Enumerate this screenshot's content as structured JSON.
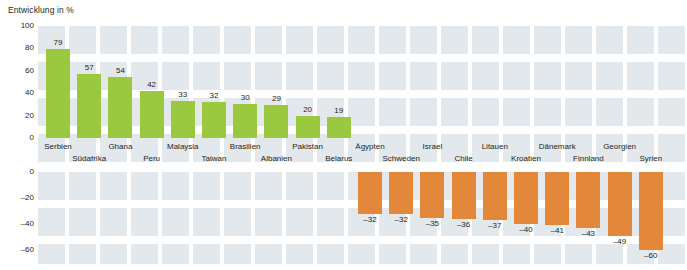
{
  "chart": {
    "title": "Entwicklung in %"
  },
  "chart_data": {
    "type": "bar",
    "title": "Entwicklung in %",
    "xlabel": "",
    "ylabel": "Entwicklung in %",
    "ylim": [
      -80,
      100
    ],
    "grid": true,
    "legend": false,
    "yticks": [
      "100",
      "80",
      "60",
      "40",
      "20",
      "0",
      "0",
      "-20",
      "-40",
      "-60",
      "-80"
    ],
    "ytick_values": [
      100,
      80,
      60,
      40,
      20,
      0,
      0,
      -20,
      -40,
      -60,
      -80
    ],
    "series_colors": {
      "positive": "#9ac83f",
      "negative": "#e3873a"
    },
    "categories": [
      "Serbien",
      "Südafrika",
      "Ghana",
      "Peru",
      "Malaysia",
      "Taiwan",
      "Brasilien",
      "Albanien",
      "Pakistan",
      "Belarus",
      "Ägypten",
      "Schweden",
      "Israel",
      "Chile",
      "Litauen",
      "Kroatien",
      "Dänemark",
      "Finnland",
      "Georgien",
      "Syrien"
    ],
    "values": [
      79,
      57,
      54,
      42,
      33,
      32,
      30,
      29,
      20,
      19,
      -32,
      -32,
      -35,
      -36,
      -37,
      -40,
      -41,
      -43,
      -49,
      -60
    ],
    "value_labels": [
      "79",
      "57",
      "54",
      "42",
      "33",
      "32",
      "30",
      "29",
      "20",
      "19",
      "–32",
      "–32",
      "–35",
      "–36",
      "–37",
      "–40",
      "–41",
      "–43",
      "–49",
      "–60"
    ]
  },
  "bars": [
    {
      "label": "Serbien",
      "value_label": "79",
      "value": 79,
      "sign": "pos",
      "row": 0
    },
    {
      "label": "Südafrika",
      "value_label": "57",
      "value": 57,
      "sign": "pos",
      "row": 1
    },
    {
      "label": "Ghana",
      "value_label": "54",
      "value": 54,
      "sign": "pos",
      "row": 0
    },
    {
      "label": "Peru",
      "value_label": "42",
      "value": 42,
      "sign": "pos",
      "row": 1
    },
    {
      "label": "Malaysia",
      "value_label": "33",
      "value": 33,
      "sign": "pos",
      "row": 0
    },
    {
      "label": "Taiwan",
      "value_label": "32",
      "value": 32,
      "sign": "pos",
      "row": 1
    },
    {
      "label": "Brasilien",
      "value_label": "30",
      "value": 30,
      "sign": "pos",
      "row": 0
    },
    {
      "label": "Albanien",
      "value_label": "29",
      "value": 29,
      "sign": "pos",
      "row": 1
    },
    {
      "label": "Pakistan",
      "value_label": "20",
      "value": 20,
      "sign": "pos",
      "row": 0
    },
    {
      "label": "Belarus",
      "value_label": "19",
      "value": 19,
      "sign": "pos",
      "row": 1
    },
    {
      "label": "Ägypten",
      "value_label": "–32",
      "value": -32,
      "sign": "neg",
      "row": 0
    },
    {
      "label": "Schweden",
      "value_label": "–32",
      "value": -32,
      "sign": "neg",
      "row": 1
    },
    {
      "label": "Israel",
      "value_label": "–35",
      "value": -35,
      "sign": "neg",
      "row": 0
    },
    {
      "label": "Chile",
      "value_label": "–36",
      "value": -36,
      "sign": "neg",
      "row": 1
    },
    {
      "label": "Litauen",
      "value_label": "–37",
      "value": -37,
      "sign": "neg",
      "row": 0
    },
    {
      "label": "Kroatien",
      "value_label": "–40",
      "value": -40,
      "sign": "neg",
      "row": 1
    },
    {
      "label": "Dänemark",
      "value_label": "–41",
      "value": -41,
      "sign": "neg",
      "row": 0
    },
    {
      "label": "Finnland",
      "value_label": "–43",
      "value": -43,
      "sign": "neg",
      "row": 1
    },
    {
      "label": "Georgien",
      "value_label": "–49",
      "value": -49,
      "sign": "neg",
      "row": 0
    },
    {
      "label": "Syrien",
      "value_label": "–60",
      "value": -60,
      "sign": "neg",
      "row": 1
    }
  ],
  "yaxis": {
    "upper_ticks": [
      "100",
      "80",
      "60",
      "40",
      "20",
      "0"
    ],
    "lower_ticks": [
      "0",
      "–20",
      "–40",
      "–60",
      "–80"
    ]
  }
}
